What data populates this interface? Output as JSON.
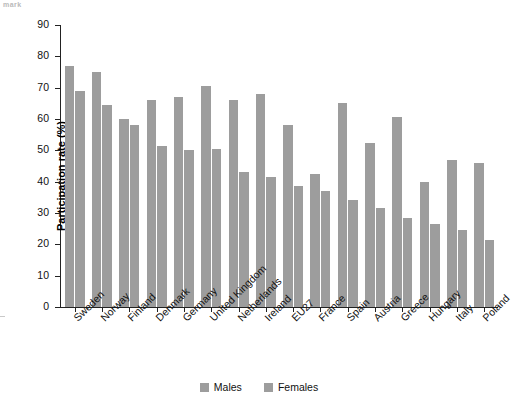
{
  "corner_mark": "mark",
  "chart_data": {
    "type": "bar",
    "title": "",
    "xlabel": "",
    "ylabel": "Participation rate (%)",
    "ylim": [
      0,
      90
    ],
    "yticks": [
      0,
      10,
      20,
      30,
      40,
      50,
      60,
      70,
      80,
      90
    ],
    "grid": false,
    "legend_position": "bottom",
    "categories": [
      "Sweden",
      "Norway",
      "Finland",
      "Denmark",
      "Germany",
      "United Kingdom",
      "Netherlands",
      "Ireland",
      "EU27",
      "France",
      "Spain",
      "Austria",
      "Greece",
      "Hungary",
      "Italy",
      "Poland"
    ],
    "series": [
      {
        "name": "Males",
        "color": "#9d9d9d",
        "values": [
          77,
          75,
          60,
          66,
          67,
          70.5,
          66,
          68,
          58,
          42.5,
          65,
          52.5,
          60.5,
          40,
          47,
          46
        ]
      },
      {
        "name": "Females",
        "color": "#9d9d9d",
        "values": [
          69,
          64.5,
          58,
          51.5,
          50,
          50.5,
          43,
          41.5,
          38.5,
          37,
          34,
          31.5,
          28.5,
          26.5,
          24.5,
          21.5
        ]
      }
    ]
  }
}
